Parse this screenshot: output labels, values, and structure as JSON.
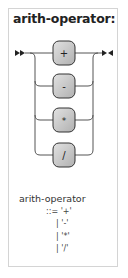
{
  "title": "arith-operator:",
  "diagram": {
    "terminals": [
      "+",
      "-",
      "*",
      "/"
    ],
    "colors": {
      "box_fill": "#c8c8c8",
      "box_stroke": "#333333",
      "line": "#555555",
      "arrow": "#222222"
    }
  },
  "grammar": {
    "rule_name": "arith-operator",
    "lines": [
      "::= '+'",
      "| '-'",
      "| '*'",
      "| '/'"
    ]
  }
}
